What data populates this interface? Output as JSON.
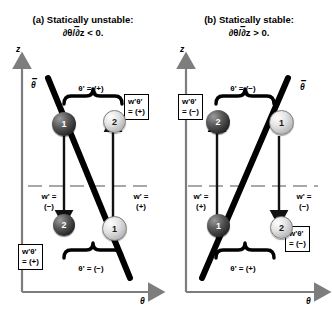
{
  "figure": {
    "width": 332,
    "height": 313,
    "kind": "schematic-diagram",
    "topic": "Buoyancy flux sign convention for statically unstable and stable stratification"
  },
  "panels": [
    {
      "id": "a",
      "title_line1": "(a) Statically unstable:",
      "title_line2": "∂θ/∂z < 0.",
      "title_overbar_char": "–",
      "axes": {
        "y_label": "z",
        "x_label": "θ",
        "profile_label": "θ",
        "profile_label_overbar": true,
        "profile_slope": "negative"
      },
      "reference_line": "dashed-mean-level",
      "parcels": [
        {
          "id": "1",
          "shade": "dark",
          "position": "upper-left",
          "displacement_arrow": "down",
          "w_prime": "w' =\n(−)"
        },
        {
          "id": "2",
          "shade": "light",
          "position": "upper-right",
          "displacement_arrow": "up",
          "w_prime": "w' =\n(+)"
        },
        {
          "id": "2",
          "shade": "dark",
          "position": "lower-left",
          "displacement_arrow": "down",
          "w_prime": null
        },
        {
          "id": "1",
          "shade": "light",
          "position": "lower-right",
          "displacement_arrow": "up",
          "w_prime": null
        }
      ],
      "brace_top_label": "θ' = (+)",
      "brace_bottom_label": "θ' = (−)",
      "flux_box_top_l1": "w'θ'",
      "flux_box_top_l2": "= (+)",
      "flux_box_bottom_l1": "w'θ'",
      "flux_box_bottom_l2": "= (+)",
      "w_left_l1": "w' =",
      "w_left_l2": "(−)",
      "w_right_l1": "w' =",
      "w_right_l2": "(+)"
    },
    {
      "id": "b",
      "title_line1": "(b) Statically stable:",
      "title_line2": "∂θ/∂z > 0.",
      "title_overbar_char": "–",
      "axes": {
        "y_label": "z",
        "x_label": "θ",
        "profile_label": "θ",
        "profile_label_overbar": true,
        "profile_slope": "positive"
      },
      "reference_line": "dashed-mean-level",
      "parcels": [
        {
          "id": "2",
          "shade": "dark",
          "position": "upper-left",
          "displacement_arrow": "up",
          "w_prime": "w' =\n(+)"
        },
        {
          "id": "1",
          "shade": "light",
          "position": "upper-right",
          "displacement_arrow": "down",
          "w_prime": "w' =\n(−)"
        },
        {
          "id": "1",
          "shade": "dark",
          "position": "lower-left",
          "displacement_arrow": "up",
          "w_prime": null
        },
        {
          "id": "2",
          "shade": "light",
          "position": "lower-right",
          "displacement_arrow": "down",
          "w_prime": null
        }
      ],
      "brace_top_label": "θ' = (−)",
      "brace_bottom_label": "θ' = (+)",
      "flux_box_top_l1": "w'θ'",
      "flux_box_top_l2": "= (−)",
      "flux_box_bottom_l1": "w'θ'",
      "flux_box_bottom_l2": "= (−)",
      "w_left_l1": "w' =",
      "w_left_l2": "(+)",
      "w_right_l1": "w' =",
      "w_right_l2": "(−)"
    }
  ],
  "colors": {
    "background": "#ffffff",
    "axis": "#7d7d7d",
    "profile_line": "#000000",
    "dashed_line": "#8c8c8c",
    "arrow": "#111111",
    "sphere_dark": "#2f2f2f",
    "sphere_light": "#d8d8d8"
  }
}
